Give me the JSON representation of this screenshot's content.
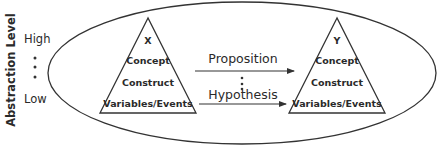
{
  "axis": {
    "title": "Abstraction Level",
    "high": "High",
    "low": "Low",
    "ellipsis": "⋮"
  },
  "left_triangle": {
    "label": "X",
    "levels": [
      "Concept",
      "Construct",
      "Variables/Events"
    ]
  },
  "right_triangle": {
    "label": "Y",
    "levels": [
      "Concept",
      "Construct",
      "Variables/Events"
    ]
  },
  "relations": {
    "top": "Proposition",
    "bottom": "Hypothesis",
    "ellipsis": "⋮"
  },
  "colors": {
    "stroke": "#333333",
    "text": "#2a2a2a",
    "background": "#ffffff"
  }
}
